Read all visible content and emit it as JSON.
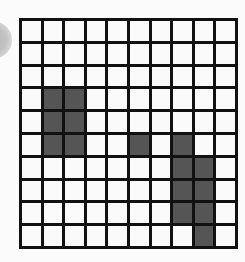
{
  "grid": {
    "rows": 10,
    "cols": 10,
    "line_color": "#111111",
    "empty_color": "#fafafa",
    "filled_color": "#555555",
    "filled_cells": [
      [
        3,
        1
      ],
      [
        3,
        2
      ],
      [
        4,
        1
      ],
      [
        4,
        2
      ],
      [
        5,
        1
      ],
      [
        5,
        2
      ],
      [
        5,
        5
      ],
      [
        5,
        7
      ],
      [
        6,
        7
      ],
      [
        6,
        8
      ],
      [
        7,
        7
      ],
      [
        7,
        8
      ],
      [
        8,
        7
      ],
      [
        8,
        8
      ],
      [
        9,
        8
      ]
    ]
  },
  "decorations": {
    "left_edge_circle_color": "#c0c0c0"
  }
}
